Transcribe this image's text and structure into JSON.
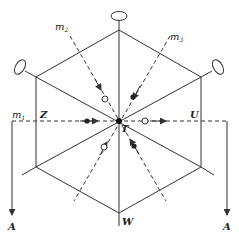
{
  "diagram": {
    "title": "",
    "labels": {
      "m1": "m",
      "m1_sub": "1",
      "m2": "m",
      "m2_sub": "2",
      "m3": "m",
      "m3_sub": "3",
      "Z": "Z",
      "U": "U",
      "T": "T",
      "W": "W",
      "A_left": "A",
      "A_right": "A"
    },
    "nodes": [
      {
        "id": "T",
        "role": "center",
        "x": 119,
        "y": 121
      },
      {
        "id": "top",
        "x": 119,
        "y": 30
      },
      {
        "id": "upper-left",
        "x": 36,
        "y": 77
      },
      {
        "id": "upper-right",
        "x": 201,
        "y": 77
      },
      {
        "id": "lower-left",
        "x": 36,
        "y": 167
      },
      {
        "id": "lower-right",
        "x": 201,
        "y": 167
      },
      {
        "id": "W",
        "x": 119,
        "y": 213
      }
    ],
    "colors": {
      "stroke": "#333333",
      "background": "#ffffff"
    }
  }
}
